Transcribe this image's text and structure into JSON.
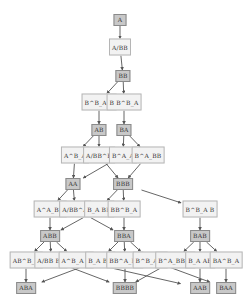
{
  "diagram": {
    "type": "directed-graph",
    "colors": {
      "word_fill": "#c8c8c8",
      "word_border": "#8a8a8a",
      "move_fill": "#f2f2f2",
      "move_border": "#b5b5b5",
      "edge": "#555555"
    },
    "nodes": [
      {
        "id": "n0",
        "kind": "word",
        "label": "A",
        "x": 120,
        "y": 20
      },
      {
        "id": "n1",
        "kind": "move",
        "label": "A/BB",
        "x": 120,
        "y": 47
      },
      {
        "id": "n2",
        "kind": "word",
        "label": "BB",
        "x": 123,
        "y": 76
      },
      {
        "id": "n3",
        "kind": "move",
        "label": "B^B_A B",
        "x": 99,
        "y": 102
      },
      {
        "id": "n4",
        "kind": "move",
        "label": "B B^B_A",
        "x": 124,
        "y": 102
      },
      {
        "id": "n5",
        "kind": "word",
        "label": "AB",
        "x": 99,
        "y": 130
      },
      {
        "id": "n6",
        "kind": "word",
        "label": "BA",
        "x": 124,
        "y": 130
      },
      {
        "id": "n7",
        "kind": "move",
        "label": "A^B_A",
        "x": 75,
        "y": 155
      },
      {
        "id": "n8",
        "kind": "move",
        "label": "A/BB^B",
        "x": 99,
        "y": 155
      },
      {
        "id": "n9",
        "kind": "move",
        "label": "B^A_A",
        "x": 123,
        "y": 155
      },
      {
        "id": "n10",
        "kind": "move",
        "label": "B^A_BB",
        "x": 148,
        "y": 155
      },
      {
        "id": "n11",
        "kind": "word",
        "label": "AA",
        "x": 73,
        "y": 184
      },
      {
        "id": "n12",
        "kind": "word",
        "label": "BBB",
        "x": 123,
        "y": 184
      },
      {
        "id": "n13",
        "kind": "move",
        "label": "A^A_BB",
        "x": 50,
        "y": 209
      },
      {
        "id": "n14",
        "kind": "move",
        "label": "A/BB^A",
        "x": 75,
        "y": 209
      },
      {
        "id": "n15",
        "kind": "move",
        "label": "B_A BB",
        "x": 99,
        "y": 209
      },
      {
        "id": "n16",
        "kind": "move",
        "label": "BB^B_A",
        "x": 124,
        "y": 209
      },
      {
        "id": "n17",
        "kind": "move",
        "label": "B^B_A B",
        "x": 200,
        "y": 209
      },
      {
        "id": "n18",
        "kind": "word",
        "label": "ABB",
        "x": 50,
        "y": 236
      },
      {
        "id": "n19",
        "kind": "word",
        "label": "BBA",
        "x": 124,
        "y": 236
      },
      {
        "id": "n20",
        "kind": "word",
        "label": "BAB",
        "x": 200,
        "y": 236
      },
      {
        "id": "n21",
        "kind": "move",
        "label": "AB^B_A",
        "x": 26,
        "y": 260
      },
      {
        "id": "n22",
        "kind": "move",
        "label": "A/BB BB",
        "x": 51,
        "y": 260
      },
      {
        "id": "n23",
        "kind": "move",
        "label": "A^B_A B",
        "x": 76,
        "y": 260
      },
      {
        "id": "n24",
        "kind": "move",
        "label": "B_A BA",
        "x": 100,
        "y": 260
      },
      {
        "id": "n25",
        "kind": "move",
        "label": "BB^A_BB",
        "x": 125,
        "y": 260
      },
      {
        "id": "n26",
        "kind": "move",
        "label": "B^B_A A",
        "x": 150,
        "y": 260
      },
      {
        "id": "n27",
        "kind": "move",
        "label": "B^A_BB B",
        "x": 175,
        "y": 260
      },
      {
        "id": "n28",
        "kind": "move",
        "label": "B_A AB",
        "x": 200,
        "y": 260
      },
      {
        "id": "n29",
        "kind": "move",
        "label": "BA^B_A",
        "x": 226,
        "y": 260
      },
      {
        "id": "n30",
        "kind": "word",
        "label": "ABA",
        "x": 26,
        "y": 288
      },
      {
        "id": "n31",
        "kind": "word",
        "label": "BBBB",
        "x": 125,
        "y": 288
      },
      {
        "id": "n32",
        "kind": "word",
        "label": "AAB",
        "x": 200,
        "y": 288
      },
      {
        "id": "n33",
        "kind": "word",
        "label": "BAA",
        "x": 226,
        "y": 288
      }
    ],
    "edges": [
      [
        "n0",
        "n1"
      ],
      [
        "n1",
        "n2"
      ],
      [
        "n2",
        "n3"
      ],
      [
        "n2",
        "n4"
      ],
      [
        "n3",
        "n5"
      ],
      [
        "n4",
        "n6"
      ],
      [
        "n5",
        "n7"
      ],
      [
        "n5",
        "n8"
      ],
      [
        "n6",
        "n9"
      ],
      [
        "n6",
        "n10"
      ],
      [
        "n7",
        "n11"
      ],
      [
        "n8",
        "n12"
      ],
      [
        "n9",
        "n11"
      ],
      [
        "n10",
        "n12"
      ],
      [
        "n11",
        "n13"
      ],
      [
        "n11",
        "n14"
      ],
      [
        "n12",
        "n15"
      ],
      [
        "n12",
        "n16"
      ],
      [
        "n12",
        "n17"
      ],
      [
        "n13",
        "n18"
      ],
      [
        "n14",
        "n19"
      ],
      [
        "n15",
        "n18"
      ],
      [
        "n16",
        "n19"
      ],
      [
        "n17",
        "n20"
      ],
      [
        "n18",
        "n21"
      ],
      [
        "n18",
        "n22"
      ],
      [
        "n18",
        "n23"
      ],
      [
        "n19",
        "n24"
      ],
      [
        "n19",
        "n25"
      ],
      [
        "n19",
        "n26"
      ],
      [
        "n20",
        "n27"
      ],
      [
        "n20",
        "n28"
      ],
      [
        "n20",
        "n29"
      ],
      [
        "n21",
        "n30"
      ],
      [
        "n22",
        "n31"
      ],
      [
        "n23",
        "n32"
      ],
      [
        "n24",
        "n30"
      ],
      [
        "n25",
        "n31"
      ],
      [
        "n26",
        "n33"
      ],
      [
        "n27",
        "n31"
      ],
      [
        "n28",
        "n32"
      ],
      [
        "n29",
        "n33"
      ]
    ]
  }
}
